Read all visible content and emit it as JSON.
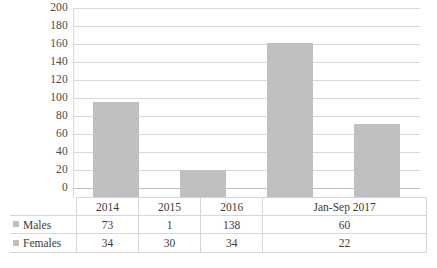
{
  "chart_data": {
    "type": "bar",
    "title": "",
    "subtitle": "",
    "xlabel": "",
    "ylabel": "",
    "ylim": [
      0,
      200
    ],
    "ytick_step": 20,
    "yticks": [
      200,
      180,
      160,
      140,
      120,
      100,
      80,
      60,
      40,
      20,
      0
    ],
    "grid": true,
    "legend_position": "table-row-labels",
    "stacked": true,
    "categories": [
      "2014",
      "2015",
      "2016",
      "Jan-Sep 2017"
    ],
    "series": [
      {
        "name": "Males",
        "values": [
          73,
          1,
          138,
          60
        ]
      },
      {
        "name": "Females",
        "values": [
          34,
          30,
          34,
          22
        ]
      }
    ],
    "bar_totals": [
      107,
      31,
      172,
      82
    ],
    "colors": {
      "bar": "#BFBFBF",
      "gridline": "#D9D9D9",
      "text": "#3C3C3C",
      "table_border": "#D6D6D6",
      "legend_swatch": "#BFBFBF"
    }
  },
  "table": {
    "header_row": [
      "",
      "2014",
      "2015",
      "2016",
      "Jan-Sep 2017"
    ],
    "rows": [
      {
        "label": "Males",
        "cells": [
          "73",
          "1",
          "138",
          "60"
        ]
      },
      {
        "label": "Females",
        "cells": [
          "34",
          "30",
          "34",
          "22"
        ]
      }
    ]
  }
}
